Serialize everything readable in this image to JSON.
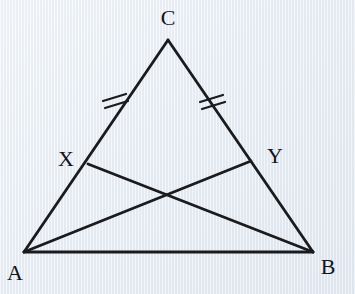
{
  "figure": {
    "background_color": "#edf1f6",
    "line_color": "#1b1b1e",
    "label_color": "#141418",
    "stroke_width_side": 2.8,
    "stroke_width_cevian": 2.8,
    "stroke_width_tick": 2.2,
    "vertices": {
      "A": {
        "x": 24,
        "y": 252
      },
      "B": {
        "x": 313,
        "y": 252
      },
      "C": {
        "x": 168,
        "y": 40
      }
    },
    "points": {
      "X": {
        "x": 88,
        "y": 164
      },
      "Y": {
        "x": 251,
        "y": 161
      }
    },
    "segments": [
      {
        "name": "side-ab",
        "kind": "side",
        "from": "A",
        "to": "B"
      },
      {
        "name": "side-ac",
        "kind": "side",
        "from": "A",
        "to": "C"
      },
      {
        "name": "side-bc",
        "kind": "side",
        "from": "B",
        "to": "C"
      },
      {
        "name": "cevian-xb",
        "kind": "cevian",
        "from": "X",
        "to": "B"
      },
      {
        "name": "cevian-ay",
        "kind": "cevian",
        "from": "A",
        "to": "Y"
      }
    ],
    "tick_marks": [
      {
        "name": "tick-cx-upper",
        "x1": 103,
        "y1": 101,
        "x2": 126,
        "y2": 94
      },
      {
        "name": "tick-cx-lower",
        "x1": 105,
        "y1": 108,
        "x2": 128,
        "y2": 101
      },
      {
        "name": "tick-cy-upper",
        "x1": 200,
        "y1": 102,
        "x2": 223,
        "y2": 95
      },
      {
        "name": "tick-cy-lower",
        "x1": 202,
        "y1": 109,
        "x2": 225,
        "y2": 102
      }
    ],
    "labels": [
      {
        "text": "C",
        "x": 168,
        "y": 25
      },
      {
        "text": "A",
        "x": 15,
        "y": 280
      },
      {
        "text": "B",
        "x": 328,
        "y": 274
      },
      {
        "text": "X",
        "x": 66,
        "y": 166
      },
      {
        "text": "Y",
        "x": 275,
        "y": 163
      }
    ]
  }
}
